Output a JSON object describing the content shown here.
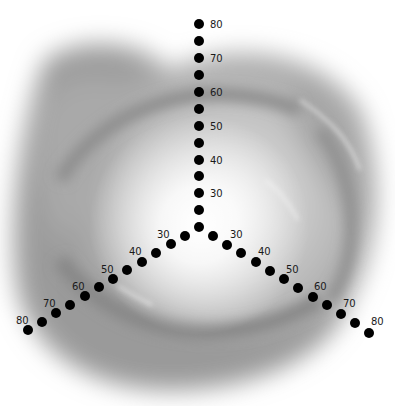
{
  "diagram": {
    "type": "three-axis dot scale",
    "center": [
      199,
      227
    ],
    "dot_radius": 5,
    "dot_color": "#000000",
    "label_color": "#1a1a1a",
    "axes": [
      {
        "name": "top",
        "labels": [
          {
            "text": "30",
            "x": 210,
            "y": 197
          },
          {
            "text": "40",
            "x": 210,
            "y": 164
          },
          {
            "text": "50",
            "x": 210,
            "y": 130
          },
          {
            "text": "60",
            "x": 210,
            "y": 96
          },
          {
            "text": "70",
            "x": 210,
            "y": 62
          },
          {
            "text": "80",
            "x": 210,
            "y": 28
          }
        ],
        "dots": [
          [
            199,
            227
          ],
          [
            199,
            210
          ],
          [
            199,
            193
          ],
          [
            199,
            176
          ],
          [
            199,
            160
          ],
          [
            199,
            143
          ],
          [
            199,
            126
          ],
          [
            199,
            109
          ],
          [
            199,
            92
          ],
          [
            199,
            75
          ],
          [
            199,
            58
          ],
          [
            199,
            41
          ],
          [
            199,
            24
          ]
        ]
      },
      {
        "name": "lower-left",
        "labels": [
          {
            "text": "30",
            "x": 157,
            "y": 238
          },
          {
            "text": "40",
            "x": 129,
            "y": 255
          },
          {
            "text": "50",
            "x": 101,
            "y": 273
          },
          {
            "text": "60",
            "x": 72,
            "y": 290
          },
          {
            "text": "70",
            "x": 43,
            "y": 307
          },
          {
            "text": "80",
            "x": 16,
            "y": 324
          }
        ],
        "dots": [
          [
            185,
            236
          ],
          [
            171,
            244
          ],
          [
            156,
            253
          ],
          [
            142,
            262
          ],
          [
            127,
            270
          ],
          [
            113,
            279
          ],
          [
            99,
            287
          ],
          [
            85,
            296
          ],
          [
            70,
            305
          ],
          [
            56,
            313
          ],
          [
            42,
            322
          ],
          [
            28,
            330
          ]
        ]
      },
      {
        "name": "lower-right",
        "labels": [
          {
            "text": "30",
            "x": 230,
            "y": 238
          },
          {
            "text": "40",
            "x": 258,
            "y": 255
          },
          {
            "text": "50",
            "x": 286,
            "y": 273
          },
          {
            "text": "60",
            "x": 314,
            "y": 290
          },
          {
            "text": "70",
            "x": 343,
            "y": 307
          },
          {
            "text": "80",
            "x": 371,
            "y": 325
          }
        ],
        "dots": [
          [
            213,
            236
          ],
          [
            227,
            245
          ],
          [
            241,
            253
          ],
          [
            256,
            262
          ],
          [
            270,
            271
          ],
          [
            284,
            279
          ],
          [
            298,
            288
          ],
          [
            313,
            297
          ],
          [
            327,
            305
          ],
          [
            341,
            314
          ],
          [
            355,
            323
          ],
          [
            369,
            333
          ]
        ]
      }
    ],
    "background": {
      "description": "blurred grayscale swirl with bright white glow at center",
      "colors": [
        "#ffffff",
        "#d9d9d9",
        "#a8a8a8",
        "#7a7a7a"
      ]
    }
  }
}
